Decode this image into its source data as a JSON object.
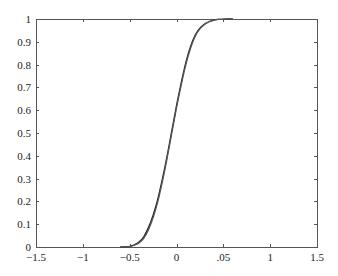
{
  "chart_data": {
    "type": "line",
    "title": "",
    "xlabel": "",
    "ylabel": "",
    "xlim": [
      -1.5,
      1.5
    ],
    "ylim": [
      0,
      1
    ],
    "grid": false,
    "legend": null,
    "x_ticks": [
      -1.5,
      -1,
      -0.5,
      0,
      0.5,
      1,
      1.5
    ],
    "x_tick_labels": [
      "-1.5",
      "-1",
      "-0.5",
      "0",
      ".05",
      "1",
      "1.5"
    ],
    "y_ticks": [
      0,
      0.1,
      0.2,
      0.3,
      0.4,
      0.5,
      0.6,
      0.7,
      0.8,
      0.9,
      1
    ],
    "y_tick_labels": [
      "0",
      "0.1",
      "0.2",
      "0.3",
      "0.4",
      "0.5",
      "0.6",
      "0.7",
      "0.8",
      "0.9",
      "1"
    ],
    "series": [
      {
        "name": "curve-1",
        "color": "#222222",
        "x": [
          -0.6,
          -0.5,
          -0.45,
          -0.4,
          -0.35,
          -0.3,
          -0.25,
          -0.2,
          -0.15,
          -0.1,
          -0.05,
          0.0,
          0.05,
          0.1,
          0.15,
          0.2,
          0.25,
          0.3,
          0.35,
          0.4,
          0.45,
          0.5,
          0.55,
          0.6
        ],
        "y": [
          0.0,
          0.003,
          0.01,
          0.022,
          0.045,
          0.085,
          0.14,
          0.21,
          0.3,
          0.4,
          0.51,
          0.62,
          0.72,
          0.81,
          0.88,
          0.93,
          0.96,
          0.978,
          0.989,
          0.995,
          0.998,
          0.999,
          1.0,
          1.0
        ]
      },
      {
        "name": "curve-2",
        "color": "#555555",
        "x": [
          -0.6,
          -0.5,
          -0.45,
          -0.4,
          -0.35,
          -0.3,
          -0.25,
          -0.2,
          -0.15,
          -0.1,
          -0.05,
          0.0,
          0.05,
          0.1,
          0.15,
          0.2,
          0.25,
          0.3,
          0.35,
          0.4,
          0.45,
          0.5,
          0.55,
          0.6
        ],
        "y": [
          0.0,
          0.002,
          0.008,
          0.018,
          0.038,
          0.075,
          0.128,
          0.198,
          0.288,
          0.39,
          0.5,
          0.61,
          0.71,
          0.8,
          0.872,
          0.925,
          0.957,
          0.976,
          0.988,
          0.995,
          0.998,
          0.999,
          1.0,
          1.0
        ]
      }
    ]
  },
  "plot_area": {
    "left": 36,
    "top": 19,
    "right": 317,
    "bottom": 247
  },
  "colors": {
    "axis": "#555555",
    "text": "#222222",
    "background": "#ffffff"
  }
}
